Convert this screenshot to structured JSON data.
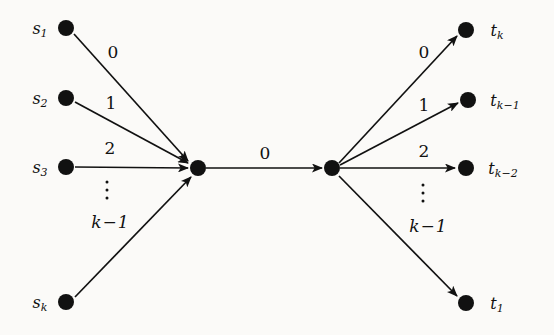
{
  "figure": {
    "background_color": "#fbfaf8",
    "ink_color": "#111111",
    "width": 554,
    "height": 335
  },
  "nodes": {
    "sources": [
      {
        "id": "s1",
        "label": "s",
        "sub": "1",
        "x": 66,
        "y": 28,
        "label_x": 40,
        "label_y": 29
      },
      {
        "id": "s2",
        "label": "s",
        "sub": "2",
        "x": 66,
        "y": 98,
        "label_x": 40,
        "label_y": 99
      },
      {
        "id": "s3",
        "label": "s",
        "sub": "3",
        "x": 66,
        "y": 167,
        "label_x": 40,
        "label_y": 168
      },
      {
        "id": "sk",
        "label": "s",
        "sub": "k",
        "x": 66,
        "y": 302,
        "label_x": 40,
        "label_y": 303
      }
    ],
    "hubs": [
      {
        "id": "hub_left",
        "x": 198,
        "y": 168
      },
      {
        "id": "hub_right",
        "x": 332,
        "y": 168
      }
    ],
    "targets": [
      {
        "id": "tk",
        "label": "t",
        "sub": "k",
        "x": 466,
        "y": 30,
        "label_x": 497,
        "label_y": 31
      },
      {
        "id": "tk1",
        "label": "t",
        "sub": "k−1",
        "x": 468,
        "y": 100,
        "label_x": 505,
        "label_y": 101
      },
      {
        "id": "tk2",
        "label": "t",
        "sub": "k−2",
        "x": 466,
        "y": 168,
        "label_x": 503,
        "label_y": 169
      },
      {
        "id": "t1",
        "label": "t",
        "sub": "1",
        "x": 466,
        "y": 303,
        "label_x": 497,
        "label_y": 304
      }
    ]
  },
  "edges": {
    "incoming": [
      {
        "id": "e_s1",
        "from": "s1",
        "to": "hub_left",
        "label": "0",
        "label_x": 113,
        "label_y": 52
      },
      {
        "id": "e_s2",
        "from": "s2",
        "to": "hub_left",
        "label": "1",
        "label_x": 111,
        "label_y": 103
      },
      {
        "id": "e_s3",
        "from": "s3",
        "to": "hub_left",
        "label": "2",
        "label_x": 110,
        "label_y": 148
      },
      {
        "id": "e_sk",
        "from": "sk",
        "to": "hub_left",
        "label_math": true,
        "label_var": "k",
        "label_op": "−",
        "label_num": "1",
        "label_x": 110,
        "label_y": 222
      }
    ],
    "bridge": {
      "id": "e_bridge",
      "from": "hub_left",
      "to": "hub_right",
      "label": "0",
      "label_x": 265,
      "label_y": 153
    },
    "outgoing": [
      {
        "id": "e_tk",
        "from": "hub_right",
        "to": "tk",
        "label": "0",
        "label_x": 424,
        "label_y": 52
      },
      {
        "id": "e_tk1",
        "from": "hub_right",
        "to": "tk1",
        "label": "1",
        "label_x": 424,
        "label_y": 105
      },
      {
        "id": "e_tk2",
        "from": "hub_right",
        "to": "tk2",
        "label": "2",
        "label_x": 424,
        "label_y": 151
      },
      {
        "id": "e_t1",
        "from": "hub_right",
        "to": "t1",
        "label_math": true,
        "label_var": "k",
        "label_op": "−",
        "label_num": "1",
        "label_x": 428,
        "label_y": 226
      }
    ]
  },
  "ellipses": [
    {
      "id": "vdots_left",
      "x": 107,
      "y": 190
    },
    {
      "id": "vdots_right",
      "x": 423,
      "y": 193
    }
  ]
}
